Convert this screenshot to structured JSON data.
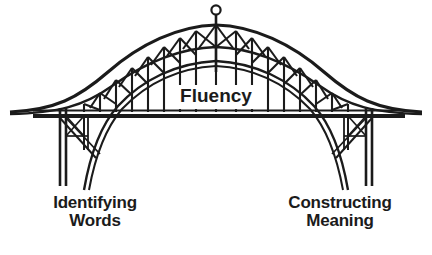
{
  "diagram": {
    "type": "truss-arch-bridge-metaphor",
    "background_color": "#ffffff",
    "ink_color": "#1b1b1b",
    "labels": {
      "center": "Fluency",
      "left_line1": "Identifying",
      "left_line2": "Words",
      "right_line1": "Constructing",
      "right_line2": "Meaning"
    },
    "parts": {
      "mast_finial": "circle-finial",
      "deck": "bridge-deck",
      "arch": "parabolic-truss-arch",
      "left_pier": "left-pier-tower",
      "right_pier": "right-pier-tower"
    }
  }
}
